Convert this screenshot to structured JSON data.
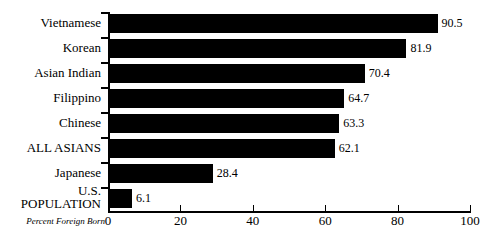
{
  "chart_data": {
    "type": "bar",
    "orientation": "horizontal",
    "title": "",
    "xlabel": "Percent Foreign Born",
    "ylabel": "",
    "xlim": [
      0,
      100
    ],
    "grid": false,
    "legend": "none",
    "categories": [
      "Vietnamese",
      "Korean",
      "Asian Indian",
      "Filippino",
      "Chinese",
      "ALL ASIANS",
      "Japanese",
      "U.S. POPULATION"
    ],
    "values": [
      90.5,
      81.9,
      70.4,
      64.7,
      63.3,
      62.1,
      28.4,
      6.1
    ],
    "value_labels": [
      "90.5",
      "81.9",
      "70.4",
      "64.7",
      "63.3",
      "62.1",
      "28.4",
      "6.1"
    ],
    "xticks": [
      0,
      20,
      40,
      60,
      80,
      100
    ],
    "xtick_labels": [
      "0",
      "20",
      "40",
      "60",
      "80",
      "100"
    ],
    "bar_color": "#000000",
    "background_color": "#ffffff"
  },
  "labels": {
    "us_population_line1": "U.S.",
    "us_population_line2": "POPULATION"
  }
}
